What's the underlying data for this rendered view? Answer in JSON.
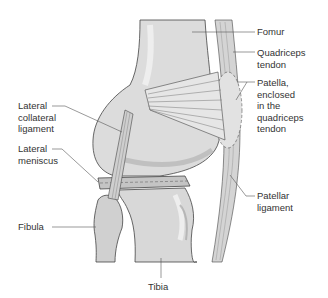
{
  "diagram": {
    "type": "anatomical illustration",
    "colors": {
      "bone": "#dcdcdc",
      "bone_shadow": "#b4b4b4",
      "bone_highlight": "#eeeeee",
      "ligament": "#c8c8c8",
      "outline": "#444444",
      "leader_line": "#555555",
      "text": "#333333"
    },
    "labels": {
      "femur": "Fomur",
      "quadriceps_tendon": "Quadriceps\ntendon",
      "patella": "Patella,\nenclosed\nin the\nquadriceps\ntendon",
      "lateral_collateral_ligament": "Lateral\ncollateral\nligament",
      "lateral_meniscus": "Lateral\nmeniscus",
      "fibula": "Fibula",
      "patellar_ligament": "Patellar\nligament",
      "tibia": "Tibia"
    }
  }
}
